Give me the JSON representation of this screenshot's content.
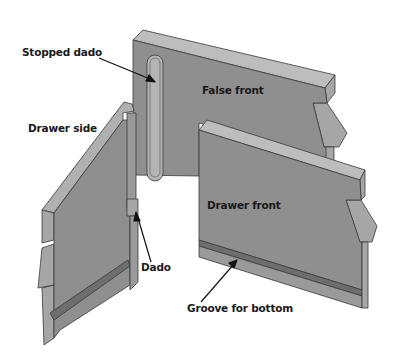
{
  "diagram": {
    "colors": {
      "background": "#ffffff",
      "face": "#8f8f8f",
      "top_edge": "#bdbdbd",
      "side_edge": "#a6a6a6",
      "groove": "#6e6e6e",
      "outline": "#3a3a3a",
      "text": "#1a1a1a"
    },
    "parts": [
      {
        "id": "false-front",
        "label": "False front"
      },
      {
        "id": "drawer-front",
        "label": "Drawer front"
      },
      {
        "id": "drawer-side",
        "label": "Drawer side"
      }
    ],
    "labels": {
      "stopped_dado": "Stopped dado",
      "false_front": "False front",
      "drawer_side": "Drawer side",
      "drawer_front": "Drawer front",
      "dado": "Dado",
      "groove_for_bottom": "Groove for bottom"
    }
  }
}
